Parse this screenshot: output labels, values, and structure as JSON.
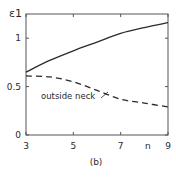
{
  "figure": {
    "caption": "(b)",
    "ylabel": "ε1",
    "xlabel": "n",
    "annotation": "outside neck"
  },
  "chart_data": {
    "type": "line",
    "title": "",
    "xlabel": "n",
    "ylabel": "ε1",
    "x": [
      3,
      4,
      5,
      6,
      7,
      8,
      9
    ],
    "series": [
      {
        "name": "solid curve",
        "style": "solid",
        "values": [
          0.65,
          0.77,
          0.87,
          0.96,
          1.05,
          1.11,
          1.16
        ]
      },
      {
        "name": "outside neck",
        "style": "dashed",
        "values": [
          0.61,
          0.6,
          0.55,
          0.46,
          0.37,
          0.33,
          0.29
        ]
      }
    ],
    "xticks": [
      3,
      5,
      7,
      9
    ],
    "xtick_labels": [
      "3",
      "5",
      "7",
      "9"
    ],
    "yticks": [
      0,
      0.5,
      1
    ],
    "ytick_labels": [
      "0",
      "0.5",
      "1"
    ],
    "xlim": [
      3,
      9
    ],
    "ylim": [
      0,
      1.25
    ],
    "grid": false,
    "legend": "none; dashed curve labelled 'outside neck' with arrow",
    "caption": "(b)",
    "colors": {
      "line": "#2a2a2a",
      "axes": "#555555"
    }
  }
}
